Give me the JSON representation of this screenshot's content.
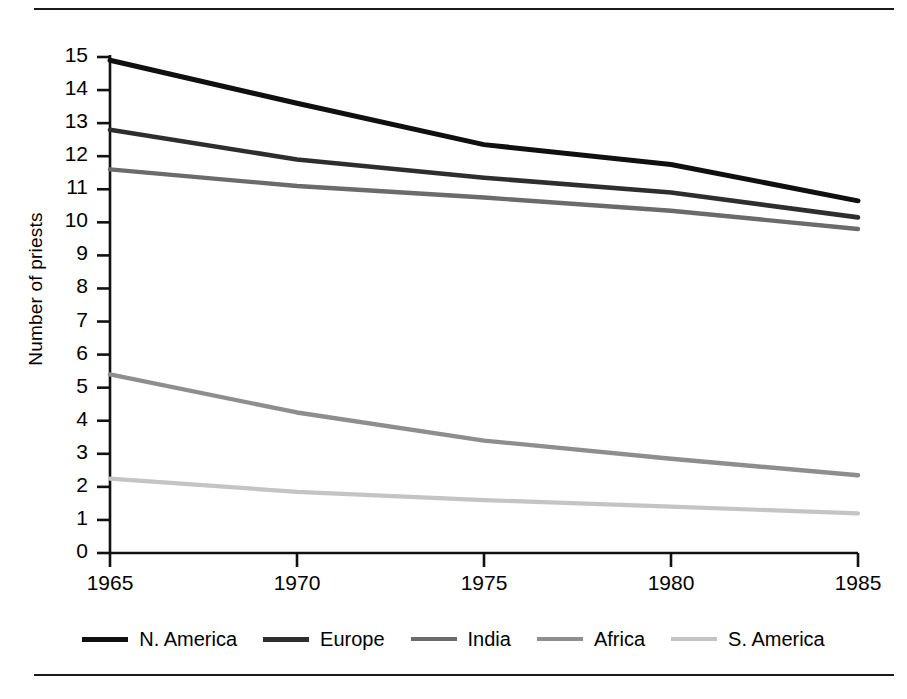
{
  "figure": {
    "rule_top": "horizontal-rule",
    "rule_bottom": "horizontal-rule"
  },
  "chart_data": {
    "type": "line",
    "title": "",
    "xlabel": "",
    "ylabel": "Number of priests",
    "x": [
      1965,
      1970,
      1975,
      1980,
      1985
    ],
    "xtick_labels": [
      "1965",
      "1970",
      "1975",
      "1980",
      "1985"
    ],
    "ytick_labels": [
      "0",
      "1",
      "2",
      "3",
      "4",
      "5",
      "6",
      "7",
      "8",
      "9",
      "10",
      "11",
      "12",
      "13",
      "14",
      "15"
    ],
    "xlim": [
      1965,
      1985
    ],
    "ylim": [
      0,
      15
    ],
    "grid": false,
    "legend_position": "bottom",
    "series": [
      {
        "name": "N. America",
        "color": "#101010",
        "width": 5.0,
        "values": [
          14.9,
          13.6,
          12.35,
          11.75,
          10.65
        ]
      },
      {
        "name": "Europe",
        "color": "#2e2e2e",
        "width": 4.6,
        "values": [
          12.8,
          11.9,
          11.35,
          10.9,
          10.15
        ]
      },
      {
        "name": "India",
        "color": "#6b6b6b",
        "width": 4.4,
        "values": [
          11.6,
          11.1,
          10.75,
          10.35,
          9.8
        ]
      },
      {
        "name": "Africa",
        "color": "#8e8e8e",
        "width": 4.4,
        "values": [
          5.4,
          4.25,
          3.4,
          2.85,
          2.35
        ]
      },
      {
        "name": "S. America",
        "color": "#c4c4c4",
        "width": 4.2,
        "values": [
          2.25,
          1.85,
          1.6,
          1.4,
          1.2
        ]
      }
    ]
  }
}
